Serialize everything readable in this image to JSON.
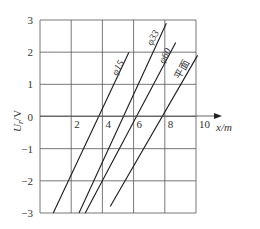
{
  "chart_data": {
    "type": "line",
    "title": "",
    "xlabel": "x/m",
    "ylabel": "U_r/V",
    "xlim": [
      0,
      10
    ],
    "ylim": [
      -3,
      3
    ],
    "grid": true,
    "x_ticks": [
      2,
      4,
      6,
      8,
      10
    ],
    "x_tick_labels": [
      "2",
      "4",
      "6",
      "8",
      "10"
    ],
    "y_ticks": [
      3,
      2,
      1,
      0,
      -1,
      -2,
      -3
    ],
    "y_tick_labels": [
      "3",
      "2",
      "1",
      "0",
      "−1",
      "−2",
      "−3"
    ],
    "series": [
      {
        "name": "φ15",
        "x": [
          0.85,
          5.7
        ],
        "y": [
          -3.0,
          2.0
        ]
      },
      {
        "name": "φ33",
        "x": [
          2.5,
          8.1
        ],
        "y": [
          -3.0,
          2.9
        ]
      },
      {
        "name": "φ60",
        "x": [
          2.9,
          8.7
        ],
        "y": [
          -3.0,
          2.3
        ]
      },
      {
        "name": "平面",
        "x": [
          4.5,
          10.1
        ],
        "y": [
          -2.8,
          1.9
        ]
      }
    ],
    "legend": "inline labels along lines"
  },
  "labels": {
    "xlabel": "x/m",
    "ylabel_main": "U",
    "ylabel_sub": "r",
    "ylabel_unit": "/V",
    "s0": "φ15",
    "s1": "φ33",
    "s2": "φ60",
    "s3": "平面"
  },
  "colors": {
    "grid": "#555555",
    "line": "#1a1a1a",
    "text": "#333333"
  }
}
